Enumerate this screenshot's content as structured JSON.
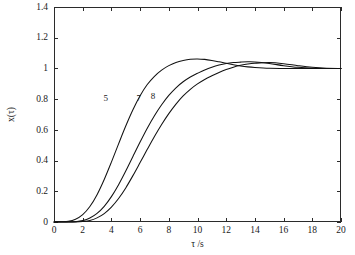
{
  "chart_data": {
    "type": "line",
    "title": "",
    "subtitle": "",
    "xlabel": "τ /s",
    "ylabel": "x(τ)",
    "xlim": [
      0,
      20
    ],
    "ylim": [
      0,
      1.4
    ],
    "xticks": [
      0,
      2,
      4,
      6,
      8,
      10,
      12,
      14,
      16,
      18,
      20
    ],
    "xticklabels": [
      "0",
      "2",
      "4",
      "6",
      "8",
      "10",
      "12",
      "14",
      "16",
      "18",
      "20"
    ],
    "yticks": [
      0,
      0.2,
      0.4,
      0.6,
      0.8,
      1,
      1.2,
      1.4
    ],
    "yticklabels": [
      "0",
      "0.2",
      "0.4",
      "0.6",
      "0.8",
      "1",
      "1.2",
      "1.4"
    ],
    "grid": false,
    "legend_position": "inline-curve-labels",
    "line_color": "#121212",
    "background_color": "#ffffff",
    "tick_direction": "in",
    "annotations": [
      {
        "text": "5",
        "x": 3.6,
        "y": 0.79
      },
      {
        "text": "7",
        "x": 5.9,
        "y": 0.79
      },
      {
        "text": "8",
        "x": 6.9,
        "y": 0.8
      }
    ],
    "x": [
      0,
      0.5,
      1,
      1.5,
      2,
      2.5,
      3,
      3.5,
      4,
      4.5,
      5,
      5.5,
      6,
      6.5,
      7,
      7.5,
      8,
      8.5,
      9,
      9.5,
      10,
      10.5,
      11,
      11.5,
      12,
      12.5,
      13,
      13.5,
      14,
      15,
      16,
      17,
      18,
      19,
      20
    ],
    "series": [
      {
        "name": "5",
        "label": "5",
        "peak_value": 1.062,
        "peak_time": 6.9,
        "settling_value": 1.0,
        "values": [
          0,
          0.001,
          0.004,
          0.018,
          0.048,
          0.101,
          0.178,
          0.277,
          0.39,
          0.509,
          0.625,
          0.731,
          0.822,
          0.895,
          0.949,
          0.989,
          1.018,
          1.039,
          1.052,
          1.06,
          1.062,
          1.059,
          1.052,
          1.043,
          1.033,
          1.024,
          1.016,
          1.01,
          1.006,
          1.001,
          1.0,
          1.0,
          1.0,
          1.0,
          1.0
        ]
      },
      {
        "name": "7",
        "label": "7",
        "peak_value": 1.043,
        "peak_time": 9.5,
        "settling_value": 1.0,
        "values": [
          0,
          0.0,
          0.0,
          0.002,
          0.009,
          0.026,
          0.056,
          0.102,
          0.165,
          0.243,
          0.332,
          0.427,
          0.521,
          0.611,
          0.692,
          0.763,
          0.824,
          0.874,
          0.913,
          0.944,
          0.968,
          0.99,
          1.008,
          1.022,
          1.032,
          1.038,
          1.041,
          1.043,
          1.042,
          1.032,
          1.018,
          1.007,
          1.001,
          1.0,
          1.0
        ]
      },
      {
        "name": "8",
        "label": "8",
        "peak_value": 1.038,
        "peak_time": 10.6,
        "settling_value": 1.0,
        "values": [
          0,
          0.0,
          0.0,
          0.0,
          0.003,
          0.01,
          0.027,
          0.055,
          0.097,
          0.153,
          0.222,
          0.302,
          0.387,
          0.473,
          0.557,
          0.635,
          0.706,
          0.768,
          0.821,
          0.864,
          0.899,
          0.928,
          0.952,
          0.974,
          0.993,
          1.008,
          1.02,
          1.029,
          1.034,
          1.038,
          1.031,
          1.018,
          1.007,
          1.001,
          1.0
        ]
      }
    ]
  }
}
